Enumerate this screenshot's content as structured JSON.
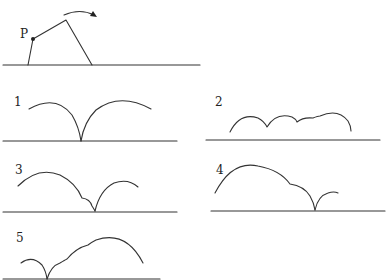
{
  "figure": {
    "main": {
      "point_label": "P",
      "description": "Rolling quadrilateral on ground with rotation arrow; point P marked"
    },
    "options": [
      {
        "label": "1"
      },
      {
        "label": "2"
      },
      {
        "label": "3"
      },
      {
        "label": "4"
      },
      {
        "label": "5"
      }
    ],
    "colors": {
      "stroke": "#333333",
      "background": "#ffffff"
    }
  }
}
